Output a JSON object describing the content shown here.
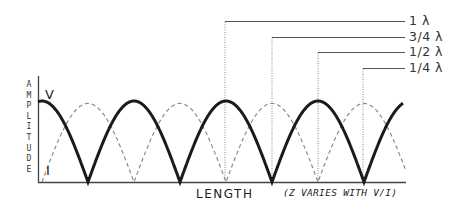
{
  "diagram": {
    "y_axis_label": "AMPLITUDE",
    "y_axis_letters": [
      "A",
      "M",
      "P",
      "L",
      "I",
      "T",
      "U",
      "D",
      "E"
    ],
    "x_axis_label": "LENGTH",
    "note": "(Z VARIES WITH V/I)",
    "curves": {
      "voltage": {
        "label": "V",
        "style": "solid thick",
        "color": "#1a1a1a"
      },
      "current": {
        "label": "I",
        "style": "dashed thin",
        "color": "#8a8a8a"
      }
    },
    "wavelength_markers": [
      {
        "label": "1 λ",
        "x": 225
      },
      {
        "label": "3/4 λ",
        "x": 272
      },
      {
        "label": "1/2 λ",
        "x": 318
      },
      {
        "label": "1/4 λ",
        "x": 363
      }
    ],
    "colors": {
      "axis": "#333333",
      "voltage": "#1a1a1a",
      "current": "#8a8a8a",
      "leader": "#555555"
    }
  }
}
